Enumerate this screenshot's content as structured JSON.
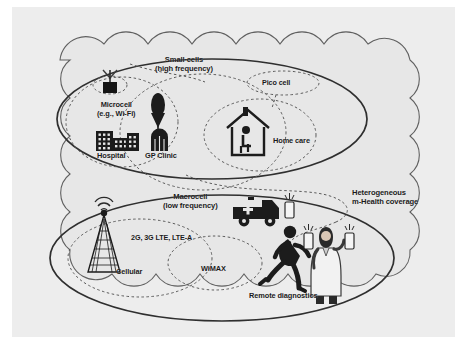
{
  "figure": {
    "kind": "network-coverage-diagram",
    "canvas": {
      "width": 467,
      "height": 363
    },
    "background_color": "#ffffff",
    "paper_color": "#eaeaea",
    "line_color": "#3b3b3b",
    "ink_color": "#1a1a1a"
  },
  "cloud": {
    "name": "heterogeneous-network-cloud",
    "fill": "#e9e9e9",
    "stroke": "#555555"
  },
  "regions": {
    "small_cells": {
      "label_line1": "Small cells",
      "label_line2": "(high frequency)",
      "shape": "ellipse",
      "style": "solid"
    },
    "macrocell": {
      "label_line1": "Macrocell",
      "label_line2": "(low frequency)",
      "shape": "ellipse",
      "style": "solid"
    },
    "microcell": {
      "label_line1": "Microcell",
      "label_line2": "(e.g., Wi-Fi)",
      "shape": "ellipse",
      "style": "dashed"
    },
    "pico_cell": {
      "label": "Pico cell",
      "shape": "ellipse",
      "style": "dashed"
    },
    "home_care": {
      "label": "Home care",
      "shape": "ellipse",
      "style": "dashed"
    },
    "cellular": {
      "label": "Cellular",
      "shape": "ellipse",
      "style": "dashed"
    },
    "wimax": {
      "label": "WiMAX",
      "shape": "ellipse",
      "style": "dashed"
    }
  },
  "annotations": {
    "technologies": "2G, 3G LTE, LTE-A",
    "coverage_line1": "Heterogeneous",
    "coverage_line2": "m-Health coverage",
    "remote_diagnostics": "Remote diagnostics"
  },
  "icons": {
    "access_point": {
      "label": "access-point-antenna"
    },
    "hospital": {
      "label": "Hospital"
    },
    "gp_clinic": {
      "label": "GP Clinic"
    },
    "tree": {
      "label": "tree"
    },
    "house": {
      "label": "house-with-seated-person"
    },
    "cell_tower": {
      "label": "cell-tower"
    },
    "ambulance": {
      "label": "ambulance"
    },
    "runner": {
      "label": "running-person"
    },
    "doctor": {
      "label": "doctor"
    },
    "phone": {
      "label": "mobile-phone"
    }
  }
}
